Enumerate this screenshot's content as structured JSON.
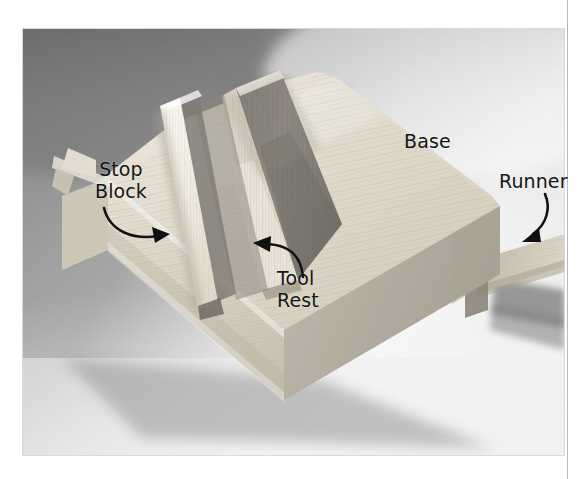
{
  "figure": {
    "kind": "photograph",
    "palette": {
      "page_background": "#ffffff",
      "page_rule": "#b9b9b9",
      "photo_bg_dark": "#8a8a8a",
      "photo_bg_light": "#f2f2f2",
      "wood_light": "#e8e3d8",
      "wood_mid": "#d2cbbd",
      "wood_shadow": "#8f8a80",
      "wood_dark": "#6d6a64",
      "label_color": "#151515"
    }
  },
  "annotations": [
    {
      "id": "stop-block",
      "label": "Stop\nBlock",
      "text_x": 95,
      "text_y": 158,
      "arrow": "curved arrow sweeping right and down toward the thin vertical fence"
    },
    {
      "id": "tool-rest",
      "label": "Tool\nRest",
      "text_x": 277,
      "text_y": 267,
      "arrow": "curved arrow sweeping up and left toward the shadowed face of the centre block"
    },
    {
      "id": "base",
      "label": "Base",
      "text_x": 404,
      "text_y": 130,
      "arrow": "none"
    },
    {
      "id": "runner",
      "label": "Runner",
      "text_x": 499,
      "text_y": 170,
      "arrow": "curved arrow sweeping down and left toward the protruding wooden strip"
    }
  ]
}
